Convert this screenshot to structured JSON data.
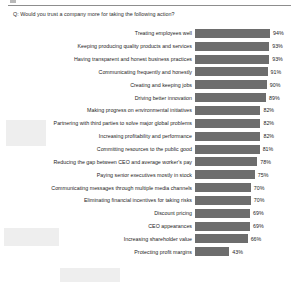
{
  "chart_data": {
    "type": "bar",
    "orientation": "horizontal",
    "title": "Q: Would you trust a company more for taking the following action?",
    "xlabel": "",
    "ylabel": "",
    "xlim": [
      0,
      100
    ],
    "grid": false,
    "legend": false,
    "value_suffix": "%",
    "bar_color": "#6d6d6d",
    "categories": [
      "Treating employees well",
      "Keeping producing quality products and services",
      "Having transparent and honest business practices",
      "Communicating frequently and honestly",
      "Creating and keeping jobs",
      "Driving better innovation",
      "Making progress on environmental initiatives",
      "Partnering with third parties to solve major global problems",
      "Increasing profitability and performance",
      "Committing resources to the public good",
      "Reducing the gap between CEO and average worker's pay",
      "Paying senior executives mostly in stock",
      "Communicating messages through multiple media channels",
      "Eliminating financial incentives for taking risks",
      "Discount pricing",
      "CEO appearances",
      "Increasing shareholder value",
      "Protecting profit margins"
    ],
    "values": [
      94,
      93,
      93,
      91,
      90,
      89,
      82,
      82,
      82,
      81,
      78,
      75,
      70,
      70,
      69,
      69,
      66,
      43
    ],
    "value_labels": [
      "94%",
      "93%",
      "93%",
      "91%",
      "90%",
      "89%",
      "82%",
      "82%",
      "82%",
      "81%",
      "78%",
      "75%",
      "70%",
      "70%",
      "69%",
      "69%",
      "66%",
      "43%"
    ]
  }
}
